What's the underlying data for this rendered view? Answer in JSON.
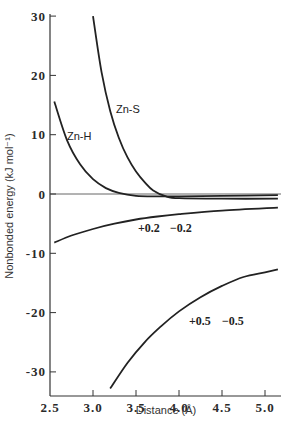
{
  "chart_data": {
    "type": "line",
    "title": "",
    "xlabel": "Distance (Å)",
    "ylabel": "Nonbonded energy (kJ mol⁻¹)",
    "xlim": [
      2.5,
      5.15
    ],
    "ylim": [
      -34,
      30
    ],
    "xticks": [
      "2.5",
      "3.0",
      "3.5",
      "4.0",
      "4.5",
      "5.0"
    ],
    "yticks": [
      "30",
      "20",
      "10",
      "0",
      "-10",
      "-20",
      "-30"
    ],
    "grid": false,
    "legend": "none (inline curve labels)",
    "series": [
      {
        "name": "Zn-H",
        "label": "Zn-H",
        "x": [
          2.55,
          2.7,
          2.85,
          3.0,
          3.15,
          3.3,
          3.5,
          3.75,
          4.0,
          4.5,
          5.15
        ],
        "y": [
          15.6,
          9.0,
          5.0,
          2.5,
          1.0,
          0.2,
          -0.3,
          -0.4,
          -0.4,
          -0.3,
          -0.2
        ]
      },
      {
        "name": "Zn-S",
        "label": "Zn-S",
        "x": [
          3.0,
          3.1,
          3.2,
          3.3,
          3.4,
          3.5,
          3.6,
          3.7,
          3.85,
          4.0,
          4.5,
          5.15
        ],
        "y": [
          30.0,
          20.5,
          14.0,
          9.5,
          6.2,
          3.8,
          2.0,
          0.6,
          -0.4,
          -0.7,
          -0.8,
          -0.8
        ]
      },
      {
        "name": "+0.2 −0.2",
        "label_plus": "+0.2",
        "label_minus": "−0.2",
        "x": [
          2.55,
          2.75,
          3.0,
          3.25,
          3.5,
          3.75,
          4.0,
          4.5,
          5.15
        ],
        "y": [
          -8.2,
          -7.0,
          -5.9,
          -5.0,
          -4.3,
          -3.8,
          -3.4,
          -2.8,
          -2.3
        ]
      },
      {
        "name": "+0.5 −0.5",
        "label_plus": "+0.5",
        "label_minus": "−0.5",
        "x": [
          3.2,
          3.4,
          3.6,
          3.8,
          4.0,
          4.25,
          4.5,
          4.75,
          5.0,
          5.15
        ],
        "y": [
          -32.8,
          -28.5,
          -25.0,
          -22.2,
          -19.8,
          -17.4,
          -15.5,
          -14.0,
          -13.2,
          -12.7
        ]
      }
    ],
    "annotations": [
      {
        "text": "Zn-H",
        "x": 2.65,
        "y": 9.5
      },
      {
        "text": "Zn-S",
        "x": 3.27,
        "y": 12.0
      },
      {
        "text": "+0.2   −0.2",
        "x": 3.75,
        "y": -6.5
      },
      {
        "text": "+0.5   −0.5",
        "x": 4.15,
        "y": -21.0
      }
    ],
    "reference_line": {
      "y": 0,
      "style": "horizontal line at zero"
    }
  },
  "labels": {
    "xlabel": "Distance (Å)",
    "ylabel": "Nonbonded energy (kJ mol⁻¹)",
    "zn_h": "Zn-H",
    "zn_s": "Zn-S",
    "plus02": "+0.2",
    "minus02": "−0.2",
    "plus05": "+0.5",
    "minus05": "−0.5",
    "x_ticks": [
      "2.5",
      "3.0",
      "3.5",
      "4.0",
      "4.5",
      "5.0"
    ],
    "y_ticks": [
      "30",
      "20",
      "10",
      "0",
      "-10",
      "-20",
      "-30"
    ]
  }
}
